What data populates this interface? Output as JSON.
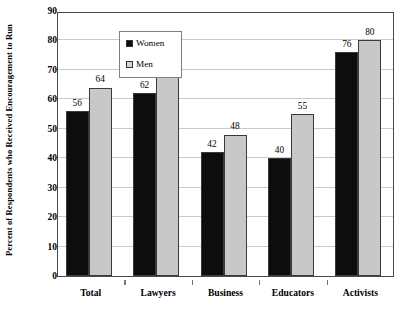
{
  "chart_data": {
    "type": "bar",
    "title": "",
    "subtitle": "",
    "xlabel": "",
    "ylabel": "Percent of Respondents who Received Encouragement to Run",
    "categories": [
      "Total",
      "Lawyers",
      "Business",
      "Educators",
      "Activists"
    ],
    "series": [
      {
        "name": "Women",
        "color": "#0d0d0d",
        "values": [
          56,
          62,
          42,
          40,
          76
        ]
      },
      {
        "name": "Men",
        "color": "#c8c8c8",
        "values": [
          64,
          70,
          48,
          55,
          80
        ]
      }
    ],
    "ylim": [
      0,
      90
    ],
    "ytick_step": 10,
    "yticks": [
      0,
      10,
      20,
      30,
      40,
      50,
      60,
      70,
      80,
      90
    ],
    "ytick_labels": [
      "0",
      "10",
      "20",
      "30",
      "40",
      "50",
      "60",
      "70",
      "80",
      "90"
    ],
    "grid": true,
    "grid_axis": "y",
    "legend_position": "top-left",
    "data_labels": true,
    "data_labels_values": [
      [
        "56",
        "64"
      ],
      [
        "62",
        "70"
      ],
      [
        "42",
        "48"
      ],
      [
        "40",
        "55"
      ],
      [
        "76",
        "80"
      ]
    ]
  },
  "legend": {
    "entries": [
      {
        "label": "Women",
        "swatch": "black-square-swatch"
      },
      {
        "label": "Men",
        "swatch": "gray-square-swatch"
      }
    ]
  },
  "colors": {
    "women_bar": "#0d0d0d",
    "men_bar": "#c8c8c8",
    "axis": "#4a4a4a",
    "gridline": "#c9c9c9",
    "background": "#ffffff",
    "text": "#000000"
  }
}
